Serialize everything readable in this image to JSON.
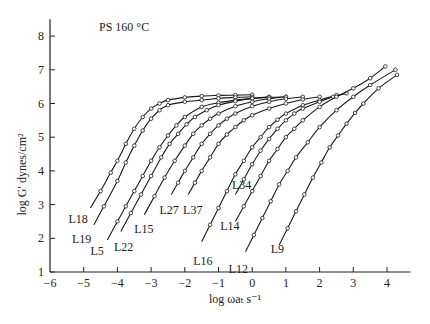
{
  "chart_data": {
    "type": "line",
    "title": "PS 160 °C",
    "xlabel": "log ωaₜ s⁻¹",
    "ylabel": "log G′ dynes/cm²",
    "xlim": [
      -6,
      4.7
    ],
    "ylim": [
      1,
      8.5
    ],
    "xticks": [
      -6,
      -5,
      -4,
      -3,
      -2,
      -1,
      0,
      1,
      2,
      3,
      4
    ],
    "xtick_labels": [
      "−6",
      "−5",
      "−4",
      "−3",
      "−2",
      "−1",
      "0",
      "1",
      "2",
      "3",
      "4"
    ],
    "yticks": [
      1,
      2,
      3,
      4,
      5,
      6,
      7,
      8
    ],
    "ytick_labels": [
      "1",
      "2",
      "3",
      "4",
      "5",
      "6",
      "7",
      "8"
    ],
    "grid": false,
    "legend": "inline labels at lower end of each curve",
    "markers": "open circles",
    "series": [
      {
        "name": "L18",
        "label_pos": [
          -5.45,
          2.55
        ],
        "points": [
          [
            -4.8,
            2.9
          ],
          [
            -4.5,
            3.4
          ],
          [
            -4.2,
            3.95
          ],
          [
            -4.0,
            4.3
          ],
          [
            -3.75,
            4.8
          ],
          [
            -3.5,
            5.25
          ],
          [
            -3.25,
            5.6
          ],
          [
            -3.0,
            5.85
          ],
          [
            -2.75,
            6.0
          ],
          [
            -2.5,
            6.1
          ],
          [
            -2.0,
            6.18
          ],
          [
            -1.5,
            6.22
          ],
          [
            -1.0,
            6.24
          ],
          [
            -0.5,
            6.25
          ],
          [
            0.0,
            6.26
          ]
        ]
      },
      {
        "name": "L19",
        "label_pos": [
          -5.35,
          1.95
        ],
        "points": [
          [
            -4.7,
            2.4
          ],
          [
            -4.4,
            2.95
          ],
          [
            -4.0,
            3.7
          ],
          [
            -3.75,
            4.25
          ],
          [
            -3.5,
            4.75
          ],
          [
            -3.25,
            5.2
          ],
          [
            -3.0,
            5.55
          ],
          [
            -2.75,
            5.8
          ],
          [
            -2.5,
            5.95
          ],
          [
            -2.0,
            6.05
          ],
          [
            -1.5,
            6.1
          ],
          [
            -1.0,
            6.15
          ],
          [
            -0.5,
            6.18
          ],
          [
            0.0,
            6.2
          ]
        ]
      },
      {
        "name": "L5",
        "label_pos": [
          -4.8,
          1.6
        ],
        "points": [
          [
            -4.3,
            1.95
          ],
          [
            -4.0,
            2.5
          ],
          [
            -3.75,
            2.95
          ],
          [
            -3.5,
            3.4
          ],
          [
            -3.25,
            3.85
          ],
          [
            -3.0,
            4.3
          ],
          [
            -2.75,
            4.7
          ],
          [
            -2.5,
            5.05
          ],
          [
            -2.25,
            5.35
          ],
          [
            -2.0,
            5.6
          ],
          [
            -1.5,
            5.9
          ],
          [
            -1.0,
            6.02
          ],
          [
            -0.5,
            6.1
          ],
          [
            0.0,
            6.15
          ],
          [
            0.5,
            6.2
          ]
        ]
      },
      {
        "name": "L22",
        "label_pos": [
          -4.1,
          1.7
        ],
        "points": [
          [
            -3.9,
            2.2
          ],
          [
            -3.6,
            2.75
          ],
          [
            -3.3,
            3.3
          ],
          [
            -3.0,
            3.85
          ],
          [
            -2.7,
            4.4
          ],
          [
            -2.45,
            4.8
          ],
          [
            -2.2,
            5.1
          ],
          [
            -1.95,
            5.38
          ],
          [
            -1.7,
            5.6
          ],
          [
            -1.35,
            5.8
          ],
          [
            -1.0,
            5.95
          ],
          [
            -0.5,
            6.07
          ],
          [
            0.0,
            6.15
          ],
          [
            0.5,
            6.18
          ],
          [
            1.0,
            6.2
          ]
        ]
      },
      {
        "name": "L15",
        "label_pos": [
          -3.5,
          2.25
        ],
        "points": [
          [
            -3.2,
            2.7
          ],
          [
            -2.9,
            3.25
          ],
          [
            -2.6,
            3.8
          ],
          [
            -2.3,
            4.3
          ],
          [
            -2.0,
            4.75
          ],
          [
            -1.75,
            5.1
          ],
          [
            -1.5,
            5.35
          ],
          [
            -1.25,
            5.55
          ],
          [
            -1.0,
            5.7
          ],
          [
            -0.5,
            5.92
          ],
          [
            0.0,
            6.05
          ],
          [
            0.5,
            6.14
          ],
          [
            1.0,
            6.2
          ]
        ]
      },
      {
        "name": "L27",
        "label_pos": [
          -2.75,
          2.8
        ],
        "points": [
          [
            -2.4,
            3.3
          ],
          [
            -2.2,
            3.65
          ],
          [
            -2.0,
            4.0
          ],
          [
            -1.75,
            4.4
          ],
          [
            -1.5,
            4.8
          ],
          [
            -1.25,
            5.1
          ],
          [
            -1.0,
            5.35
          ],
          [
            -0.75,
            5.55
          ],
          [
            -0.5,
            5.7
          ],
          [
            0.0,
            5.92
          ],
          [
            0.5,
            6.05
          ],
          [
            1.0,
            6.14
          ],
          [
            1.5,
            6.2
          ]
        ]
      },
      {
        "name": "L37",
        "label_pos": [
          -2.05,
          2.8
        ],
        "points": [
          [
            -1.9,
            3.3
          ],
          [
            -1.7,
            3.65
          ],
          [
            -1.5,
            4.0
          ],
          [
            -1.25,
            4.4
          ],
          [
            -1.0,
            4.8
          ],
          [
            -0.75,
            5.08
          ],
          [
            -0.5,
            5.3
          ],
          [
            -0.25,
            5.5
          ],
          [
            0.0,
            5.65
          ],
          [
            0.5,
            5.85
          ],
          [
            1.0,
            6.0
          ],
          [
            1.5,
            6.12
          ],
          [
            2.0,
            6.2
          ]
        ]
      },
      {
        "name": "L16",
        "label_pos": [
          -1.75,
          1.3
        ],
        "points": [
          [
            -1.5,
            1.9
          ],
          [
            -1.25,
            2.4
          ],
          [
            -1.0,
            2.9
          ],
          [
            -0.75,
            3.4
          ],
          [
            -0.5,
            3.9
          ],
          [
            -0.25,
            4.3
          ],
          [
            0.0,
            4.7
          ],
          [
            0.25,
            5.0
          ],
          [
            0.5,
            5.3
          ],
          [
            0.75,
            5.52
          ],
          [
            1.0,
            5.7
          ],
          [
            1.5,
            5.95
          ],
          [
            2.0,
            6.1
          ],
          [
            2.5,
            6.25
          ]
        ]
      },
      {
        "name": "L34",
        "label_pos": [
          -0.6,
          3.55
        ],
        "points": [
          [
            -0.5,
            3.3
          ],
          [
            -0.25,
            3.75
          ],
          [
            0.0,
            4.2
          ],
          [
            0.25,
            4.6
          ],
          [
            0.5,
            4.95
          ],
          [
            0.75,
            5.25
          ],
          [
            1.0,
            5.5
          ],
          [
            1.25,
            5.7
          ],
          [
            1.5,
            5.85
          ],
          [
            2.0,
            6.05
          ],
          [
            2.4,
            6.2
          ],
          [
            2.8,
            6.3
          ]
        ]
      },
      {
        "name": "L14",
        "label_pos": [
          -0.95,
          2.35
        ],
        "points": [
          [
            -0.5,
            2.5
          ],
          [
            -0.25,
            2.95
          ],
          [
            0.0,
            3.4
          ],
          [
            0.25,
            3.85
          ],
          [
            0.5,
            4.3
          ],
          [
            0.75,
            4.65
          ],
          [
            1.0,
            5.0
          ],
          [
            1.25,
            5.25
          ],
          [
            1.5,
            5.5
          ],
          [
            2.0,
            5.9
          ],
          [
            2.5,
            6.2
          ],
          [
            3.0,
            6.45
          ],
          [
            3.5,
            6.75
          ],
          [
            3.95,
            7.1
          ]
        ]
      },
      {
        "name": "L12",
        "label_pos": [
          -0.7,
          1.05
        ],
        "points": [
          [
            -0.2,
            1.6
          ],
          [
            0.05,
            2.1
          ],
          [
            0.3,
            2.6
          ],
          [
            0.55,
            3.1
          ],
          [
            0.8,
            3.6
          ],
          [
            1.05,
            4.0
          ],
          [
            1.3,
            4.4
          ],
          [
            1.65,
            4.85
          ],
          [
            2.0,
            5.3
          ],
          [
            2.5,
            5.8
          ],
          [
            3.0,
            6.2
          ],
          [
            3.5,
            6.55
          ],
          [
            4.25,
            7.0
          ]
        ]
      },
      {
        "name": "L9",
        "label_pos": [
          0.55,
          1.65
        ],
        "points": [
          [
            0.8,
            1.8
          ],
          [
            1.05,
            2.3
          ],
          [
            1.3,
            2.8
          ],
          [
            1.55,
            3.3
          ],
          [
            1.8,
            3.8
          ],
          [
            2.05,
            4.25
          ],
          [
            2.3,
            4.7
          ],
          [
            2.55,
            5.05
          ],
          [
            2.8,
            5.4
          ],
          [
            3.05,
            5.72
          ],
          [
            3.3,
            6.0
          ],
          [
            3.75,
            6.45
          ],
          [
            4.3,
            6.85
          ]
        ]
      }
    ]
  }
}
